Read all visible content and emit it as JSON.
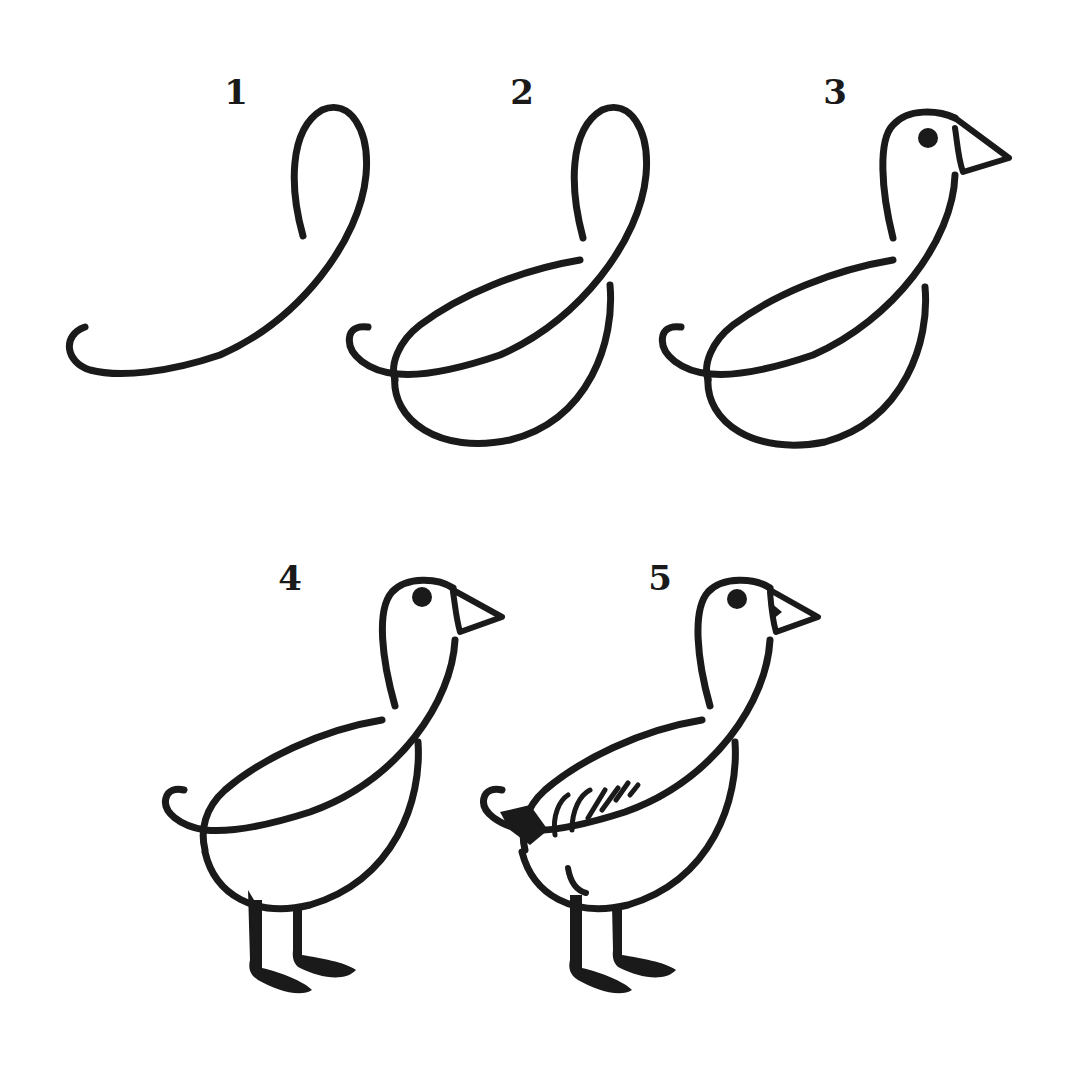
{
  "colors": {
    "ink": "#1a1a1a",
    "background": "#ffffff"
  },
  "steps": [
    {
      "number": "1",
      "label_pos": [
        236,
        92
      ],
      "description": "Tail curl and neck loop"
    },
    {
      "number": "2",
      "label_pos": [
        522,
        92
      ],
      "description": "Add back and belly curves"
    },
    {
      "number": "3",
      "label_pos": [
        835,
        92
      ],
      "description": "Add head with eye and beak"
    },
    {
      "number": "4",
      "label_pos": [
        290,
        578
      ],
      "description": "Add legs and webbed feet"
    },
    {
      "number": "5",
      "label_pos": [
        660,
        578
      ],
      "description": "Add wing feathers and details"
    }
  ]
}
